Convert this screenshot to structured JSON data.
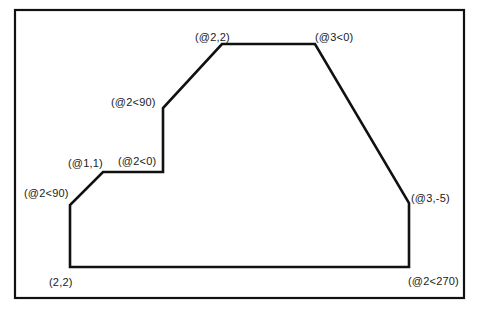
{
  "diagram": {
    "title": "",
    "type": "polyline-coordinate-entry",
    "frame": {
      "x": 15,
      "y": 10,
      "width": 449,
      "height": 288
    },
    "stroke_color": "#111111",
    "background_color": "#ffffff",
    "polyline": {
      "points": [
        [
          70,
          267
        ],
        [
          70,
          205
        ],
        [
          103,
          172
        ],
        [
          163,
          172
        ],
        [
          163,
          108
        ],
        [
          222,
          44
        ],
        [
          315,
          44
        ],
        [
          409,
          203
        ],
        [
          409,
          267
        ],
        [
          70,
          267
        ]
      ]
    },
    "labels": [
      {
        "id": "start-point",
        "text": "(2,2)",
        "x": 49,
        "y": 276
      },
      {
        "id": "polar-up-1",
        "text": "(@2<90)",
        "x": 24,
        "y": 187
      },
      {
        "id": "relative-1-1",
        "text": "(@1,1)",
        "x": 68,
        "y": 157
      },
      {
        "id": "polar-right-1",
        "text": "(@2<0)",
        "x": 118,
        "y": 155
      },
      {
        "id": "polar-up-2",
        "text": "(@2<90)",
        "x": 111,
        "y": 96
      },
      {
        "id": "relative-2-2",
        "text": "(@2,2)",
        "x": 195,
        "y": 31
      },
      {
        "id": "polar-right-2",
        "text": "(@3<0)",
        "x": 315,
        "y": 31
      },
      {
        "id": "relative-3-neg5",
        "text": "(@3,-5)",
        "x": 411,
        "y": 192
      },
      {
        "id": "polar-down",
        "text": "(@2<270)",
        "x": 408,
        "y": 275
      }
    ]
  }
}
